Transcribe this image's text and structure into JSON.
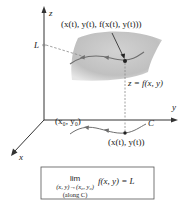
{
  "diagram": {
    "axes": {
      "x_label": "x",
      "y_label": "y",
      "z_label": "z"
    },
    "labels": {
      "point_3d": "(x(t), y(t), f(x(t), y(t)))",
      "limit_value": "L",
      "surface": "z = f(x, y)",
      "start_point": "(x₀, y₀)",
      "curve_name": "C",
      "point_2d": "(x(t), y(t))"
    },
    "formula_box": {
      "lim": "lim",
      "subscript": "(x, y)→(x₀, y₀)",
      "along": "(along C)",
      "expression": "f(x, y) = L"
    },
    "colors": {
      "surface": "#c8c8c8",
      "surface_edge": "#b0b0b0",
      "curve": "#6e6e6e",
      "axes": "#333333",
      "box_border": "#555555"
    }
  }
}
